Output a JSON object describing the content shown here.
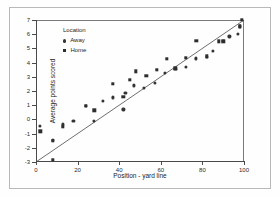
{
  "chart_data": {
    "type": "scatter",
    "title": "",
    "xlabel": "Position - yard line",
    "ylabel": "Average points scored",
    "xlim": [
      0,
      100
    ],
    "ylim": [
      -3,
      7
    ],
    "xticks": [
      0,
      20,
      40,
      60,
      80,
      100
    ],
    "yticks": [
      -3,
      -2,
      -1,
      0,
      1,
      2,
      3,
      4,
      5,
      6,
      7
    ],
    "grid": false,
    "legend": {
      "title": "Location",
      "position": "upper-left-inside",
      "entries": [
        {
          "label": "Away",
          "marker": "circle",
          "color": "#343434"
        },
        {
          "label": "Home",
          "marker": "square",
          "color": "#2d2d2d"
        }
      ]
    },
    "annotations": [],
    "series": [
      {
        "name": "Away",
        "marker": "circle",
        "color": "#343434",
        "points": [
          [
            2,
            -0.45
          ],
          [
            8,
            -1.45
          ],
          [
            13,
            -0.35
          ],
          [
            18,
            -0.1
          ],
          [
            24,
            0.95
          ],
          [
            28,
            -0.1
          ],
          [
            32,
            1.3
          ],
          [
            37,
            1.55
          ],
          [
            42,
            0.7
          ],
          [
            43,
            1.85
          ],
          [
            47,
            2.4
          ],
          [
            52,
            2.2
          ],
          [
            57,
            2.55
          ],
          [
            62,
            3.25
          ],
          [
            67,
            3.55
          ],
          [
            72,
            3.7
          ],
          [
            77,
            4.3
          ],
          [
            82,
            4.4
          ],
          [
            85,
            4.85
          ],
          [
            90,
            5.5
          ],
          [
            93,
            5.85
          ],
          [
            97,
            6.0
          ],
          [
            98,
            6.55
          ]
        ]
      },
      {
        "name": "Home",
        "marker": "square",
        "color": "#2d2d2d",
        "points": [
          [
            2,
            -0.85
          ],
          [
            8,
            -1.5
          ],
          [
            8,
            -2.85
          ],
          [
            13,
            -0.5
          ],
          [
            24,
            0.95
          ],
          [
            28,
            0.65
          ],
          [
            37,
            2.5
          ],
          [
            42,
            1.6
          ],
          [
            45,
            2.8
          ],
          [
            48,
            3.4
          ],
          [
            53,
            3.05
          ],
          [
            58,
            3.5
          ],
          [
            63,
            4.25
          ],
          [
            67,
            3.6
          ],
          [
            72,
            4.35
          ],
          [
            77,
            5.55
          ],
          [
            82,
            4.45
          ],
          [
            88,
            5.5
          ],
          [
            90,
            5.5
          ],
          [
            98,
            6.55
          ],
          [
            99,
            7.0
          ]
        ]
      }
    ],
    "fit_line": {
      "name": "regression-line",
      "from": [
        0,
        -3.0
      ],
      "to": [
        100,
        7.0
      ],
      "color": "#4a4a4a"
    }
  }
}
